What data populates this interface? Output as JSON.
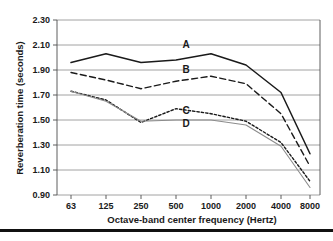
{
  "chart_data": {
    "type": "line",
    "title": "",
    "xlabel": "Octave-band center frequency (Hertz)",
    "ylabel": "Reverberation time (seconds)",
    "categories": [
      "63",
      "125",
      "250",
      "500",
      "1000",
      "2000",
      "4000",
      "8000"
    ],
    "xtick_labels": [
      "63",
      "125",
      "250",
      "500",
      "1000",
      "2000",
      "4000",
      "8000"
    ],
    "ytick_labels": [
      "2.30",
      "2.10",
      "1.90",
      "1.70",
      "1.50",
      "1.30",
      "1.10",
      "0.90"
    ],
    "ytick_values": [
      2.3,
      2.1,
      1.9,
      1.7,
      1.5,
      1.3,
      1.1,
      0.9
    ],
    "ylim": [
      0.9,
      2.3
    ],
    "grid": "horizontal",
    "legend_position": "inline-labels",
    "series": [
      {
        "name": "A",
        "label": "A",
        "style": "solid",
        "color": "#1a1a1a",
        "values": [
          1.96,
          2.03,
          1.96,
          1.98,
          2.03,
          1.94,
          1.72,
          1.23
        ]
      },
      {
        "name": "B",
        "label": "B",
        "style": "dashed",
        "color": "#1a1a1a",
        "values": [
          1.88,
          1.82,
          1.75,
          1.81,
          1.85,
          1.79,
          1.55,
          1.13
        ]
      },
      {
        "name": "C",
        "label": "C",
        "style": "dotted",
        "color": "#1a1a1a",
        "values": [
          1.73,
          1.66,
          1.48,
          1.59,
          1.55,
          1.49,
          1.32,
          1.01
        ]
      },
      {
        "name": "D",
        "label": "D",
        "style": "thin-solid",
        "color": "#8c8c8c",
        "values": [
          1.73,
          1.65,
          1.49,
          1.5,
          1.5,
          1.46,
          1.29,
          0.96
        ]
      }
    ],
    "annotations": [
      {
        "text": "A",
        "x_hint": "1000",
        "y_hint": 2.08
      },
      {
        "text": "B",
        "x_hint": "1000",
        "y_hint": 1.9
      },
      {
        "text": "C",
        "x_hint": "1000",
        "y_hint": 1.62
      },
      {
        "text": "D",
        "x_hint": "1000",
        "y_hint": 1.53
      }
    ]
  },
  "colors": {
    "grid": "#8c8c8c",
    "frame": "#4d4d4d",
    "text": "#1a1a1a",
    "series_a": "#1a1a1a",
    "series_b": "#1a1a1a",
    "series_c": "#1a1a1a",
    "series_d": "#8c8c8c",
    "rule": "#111111",
    "background": "#ffffff"
  }
}
